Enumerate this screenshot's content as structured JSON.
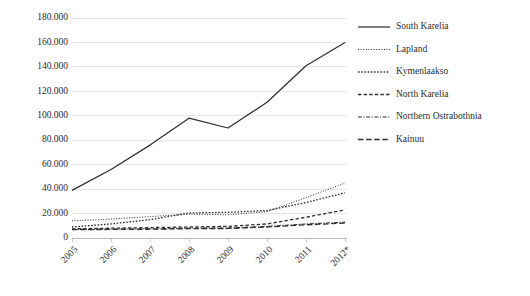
{
  "chart_data": {
    "type": "line",
    "title": "",
    "xlabel": "",
    "ylabel": "",
    "categories": [
      "2005",
      "2006",
      "2007",
      "2008",
      "2009",
      "2010",
      "2011",
      "2012*"
    ],
    "ylim": [
      0,
      180000
    ],
    "ytick_labels": [
      "180.000",
      "160.000",
      "140.000",
      "120.000",
      "100.000",
      "80.000",
      "60.000",
      "40.000",
      "20.000",
      "0"
    ],
    "ytick_values": [
      180000,
      160000,
      140000,
      120000,
      100000,
      80000,
      60000,
      40000,
      20000,
      0
    ],
    "ytick_step": 20000,
    "grid": true,
    "legend_position": "right",
    "number_format": "dot-thousands-separator",
    "series": [
      {
        "name": "South Karelia",
        "style": "solid",
        "values": [
          39000,
          56000,
          76000,
          98000,
          90000,
          111000,
          141000,
          160000
        ]
      },
      {
        "name": "Lapland",
        "style": "dotted-fine",
        "values": [
          14000,
          15500,
          17500,
          19500,
          19000,
          21500,
          33000,
          45000
        ]
      },
      {
        "name": "Kymenlaakso",
        "style": "dotted-medium",
        "values": [
          9000,
          11500,
          15000,
          20500,
          21000,
          22500,
          29000,
          37000
        ]
      },
      {
        "name": "North Karelia",
        "style": "dashed",
        "values": [
          7500,
          8000,
          8500,
          9000,
          9500,
          11500,
          17000,
          23000
        ]
      },
      {
        "name": "Northern Ostrabothnia",
        "style": "dash-dot",
        "values": [
          7000,
          7200,
          7500,
          8000,
          8200,
          9500,
          11500,
          13000
        ]
      },
      {
        "name": "Kainuu",
        "style": "long-dash",
        "values": [
          6800,
          7000,
          7200,
          7600,
          7800,
          9000,
          10800,
          12200
        ]
      }
    ]
  },
  "legend": {
    "items": [
      {
        "label": "South Karelia"
      },
      {
        "label": "Lapland"
      },
      {
        "label": "Kymenlaakso"
      },
      {
        "label": "North Karelia"
      },
      {
        "label": "Northern Ostrabothnia"
      },
      {
        "label": "Kainuu"
      }
    ]
  },
  "colors": {
    "line": "#2f2f2f",
    "grid": "#e6e6e6",
    "axis": "#b9b9b9",
    "text": "#2b2b2b",
    "background": "#ffffff"
  }
}
